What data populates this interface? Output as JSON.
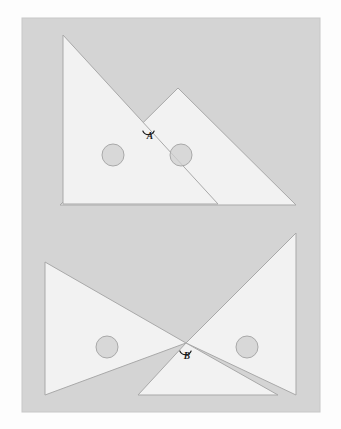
{
  "figure": {
    "panel": {
      "x": 22,
      "y": 18,
      "width": 298,
      "height": 394,
      "fill": "#d4d4d4",
      "stroke": "#c8c8c8"
    },
    "page_background": "#fdfdfd",
    "piece_fill": "#f2f2f2",
    "piece_stroke": "#a9a9a9",
    "hole_fill": "#cfcfcf",
    "hole_stroke": "#a9a9a9",
    "label_color": "#1b1b1b",
    "arrangements": [
      {
        "name": "upper-arrangement",
        "label": "A",
        "label_x": 150,
        "label_y": 139,
        "arc": {
          "cx": 148.5,
          "cy": 128.5,
          "r": 6.2,
          "start_deg": 200,
          "end_deg": 340
        },
        "vertex_x": 148.5,
        "vertex_y": 122.0,
        "pieces": [
          {
            "name": "left-triangle",
            "points": "63,35 63,204 218,204"
          },
          {
            "name": "right-triangle",
            "points": "178,88 296,205 60,205"
          }
        ],
        "holes": [
          {
            "name": "hole-left",
            "cx": 113,
            "cy": 155,
            "r": 11
          },
          {
            "name": "hole-right",
            "cx": 181,
            "cy": 155,
            "r": 11
          }
        ]
      },
      {
        "name": "lower-arrangement",
        "label": "B",
        "label_x": 187,
        "label_y": 359,
        "arc": {
          "cx": 185.5,
          "cy": 348.5,
          "r": 6.2,
          "start_deg": 200,
          "end_deg": 340
        },
        "vertex_x": 185.5,
        "vertex_y": 342.0,
        "pieces": [
          {
            "name": "left-triangle",
            "points": "45,262 45,395 186,343"
          },
          {
            "name": "right-triangle-upper",
            "points": "296,233 296,395 186,343"
          },
          {
            "name": "left-lower-triangle",
            "points": "45,262 45,395 186,343"
          },
          {
            "name": "bottom-triangle",
            "points": "138,395 278,395 186,343"
          }
        ],
        "holes": [
          {
            "name": "hole-left",
            "cx": 107,
            "cy": 347,
            "r": 11
          },
          {
            "name": "hole-right",
            "cx": 247,
            "cy": 347,
            "r": 11
          }
        ]
      }
    ]
  }
}
